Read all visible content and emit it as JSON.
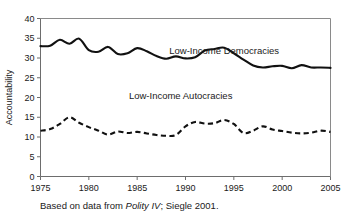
{
  "caption": {
    "prefix": "Based on data from ",
    "source_italic": "Polity IV",
    "suffix": "; Siegle 2001."
  },
  "axes": {
    "ylabel": "Accountability",
    "xlabel": "",
    "yticks": [
      "0",
      "5",
      "10",
      "15",
      "20",
      "25",
      "30",
      "35",
      "40"
    ],
    "xticks": [
      "1975",
      "1980",
      "1985",
      "1990",
      "1995",
      "2000",
      "2005"
    ]
  },
  "labels": {
    "democracies": "Low-Income Democracies",
    "autocracies": "Low-Income Autocracies"
  },
  "chart_data": {
    "type": "line",
    "title": "",
    "xlabel": "",
    "ylabel": "Accountability",
    "xlim": [
      1975,
      2005
    ],
    "ylim": [
      0,
      40
    ],
    "grid": false,
    "legend": "inline-annotations",
    "x": [
      1975,
      1976,
      1977,
      1978,
      1979,
      1980,
      1981,
      1982,
      1983,
      1984,
      1985,
      1986,
      1987,
      1988,
      1989,
      1990,
      1991,
      1992,
      1993,
      1994,
      1995,
      1996,
      1997,
      1998,
      1999,
      2000,
      2001,
      2002,
      2003,
      2004,
      2005
    ],
    "series": [
      {
        "name": "Low-Income Democracies",
        "style": "solid",
        "values": [
          33.0,
          33.1,
          34.6,
          33.6,
          34.9,
          32.0,
          31.6,
          32.8,
          31.0,
          31.2,
          32.5,
          31.7,
          30.5,
          29.8,
          30.4,
          29.9,
          30.2,
          31.9,
          32.3,
          32.6,
          31.2,
          29.6,
          28.1,
          27.6,
          27.9,
          28.0,
          27.4,
          28.2,
          27.6,
          27.6,
          27.5
        ]
      },
      {
        "name": "Low-Income Autocracies",
        "style": "dashed",
        "values": [
          11.6,
          12.0,
          13.3,
          15.0,
          13.6,
          12.5,
          11.6,
          10.6,
          11.4,
          11.0,
          11.3,
          10.9,
          10.5,
          10.3,
          10.5,
          12.7,
          13.8,
          13.4,
          13.5,
          14.3,
          13.3,
          11.0,
          11.6,
          12.7,
          11.9,
          11.5,
          11.1,
          10.9,
          11.1,
          11.6,
          11.3
        ]
      }
    ]
  },
  "annotations": [
    {
      "text": "Low-Income Democracies",
      "x": 1994.0,
      "y": 31.0
    },
    {
      "text": "Low-Income Autocracies",
      "x": 1989.5,
      "y": 19.5
    }
  ]
}
